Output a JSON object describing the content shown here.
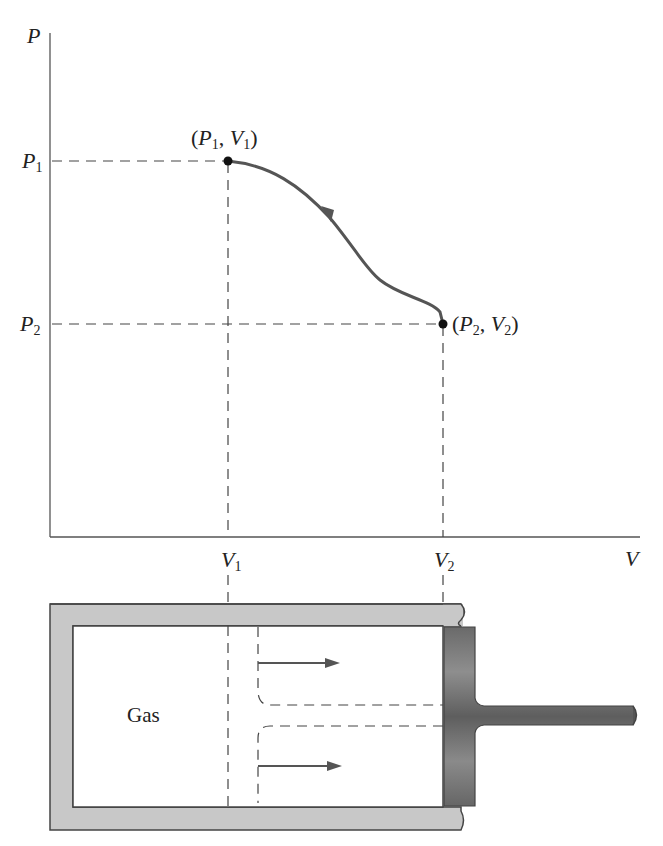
{
  "figure": {
    "type": "P-V diagram with piston-cylinder illustration",
    "axes": {
      "y_label": "P",
      "x_label": "V",
      "y_ticks": [
        {
          "main": "P",
          "sub": "1"
        },
        {
          "main": "P",
          "sub": "2"
        }
      ],
      "x_ticks": [
        {
          "main": "V",
          "sub": "1"
        },
        {
          "main": "V",
          "sub": "2"
        }
      ]
    },
    "points": [
      {
        "label_open": "(",
        "p": "P",
        "p_sub": "1",
        "sep": ", ",
        "v": "V",
        "v_sub": "1",
        "label_close": ")"
      },
      {
        "label_open": "(",
        "p": "P",
        "p_sub": "2",
        "sep": ", ",
        "v": "V",
        "v_sub": "2",
        "label_close": ")"
      }
    ],
    "process": {
      "direction": "from (P1, V1) to (P2, V2)",
      "curve_color": "#555555"
    },
    "cylinder": {
      "gas_label": "Gas",
      "wall_color": "#c8c8c8",
      "piston_color": "#6e6e6e",
      "outline_color": "#444444"
    }
  }
}
